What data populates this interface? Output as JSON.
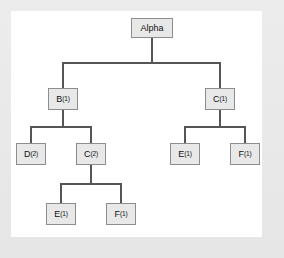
{
  "diagram": {
    "panel_background": "#ffffff",
    "frame_background": "#e9e9e9",
    "node_fill": "#e8e8e8",
    "node_border": "#8d8d8d",
    "edge_color": "#555555",
    "nodes": [
      {
        "id": "alpha",
        "label": "Alpha",
        "base": "Alpha",
        "subscript": "",
        "level": 0,
        "x": 120,
        "y": 7,
        "w": 42,
        "h": 20
      },
      {
        "id": "b1",
        "label": "B(1)",
        "base": "B",
        "subscript": "(1)",
        "level": 1,
        "x": 37,
        "y": 77,
        "w": 30,
        "h": 22
      },
      {
        "id": "c1",
        "label": "C(1)",
        "base": "C",
        "subscript": "(1)",
        "level": 1,
        "x": 194,
        "y": 77,
        "w": 30,
        "h": 22
      },
      {
        "id": "d2",
        "label": "D(2)",
        "base": "D",
        "subscript": "(2)",
        "level": 2,
        "x": 5,
        "y": 132,
        "w": 30,
        "h": 22
      },
      {
        "id": "c2",
        "label": "C(2)",
        "base": "C",
        "subscript": "(2)",
        "level": 2,
        "x": 65,
        "y": 132,
        "w": 30,
        "h": 22
      },
      {
        "id": "e1r",
        "label": "E(1)",
        "base": "E",
        "subscript": "(1)",
        "level": 2,
        "x": 159,
        "y": 132,
        "w": 30,
        "h": 22
      },
      {
        "id": "f1r",
        "label": "F(1)",
        "base": "F",
        "subscript": "(1)",
        "level": 2,
        "x": 219,
        "y": 132,
        "w": 30,
        "h": 22
      },
      {
        "id": "e1b",
        "label": "E(1)",
        "base": "E",
        "subscript": "(1)",
        "level": 3,
        "x": 35,
        "y": 192,
        "w": 30,
        "h": 22
      },
      {
        "id": "f1b",
        "label": "F(1)",
        "base": "F",
        "subscript": "(1)",
        "level": 3,
        "x": 95,
        "y": 192,
        "w": 30,
        "h": 22
      }
    ],
    "edges": [
      {
        "from": "alpha",
        "to": "b1"
      },
      {
        "from": "alpha",
        "to": "c1"
      },
      {
        "from": "b1",
        "to": "d2"
      },
      {
        "from": "b1",
        "to": "c2"
      },
      {
        "from": "c1",
        "to": "e1r"
      },
      {
        "from": "c1",
        "to": "f1r"
      },
      {
        "from": "c2",
        "to": "e1b"
      },
      {
        "from": "c2",
        "to": "f1b"
      }
    ]
  }
}
